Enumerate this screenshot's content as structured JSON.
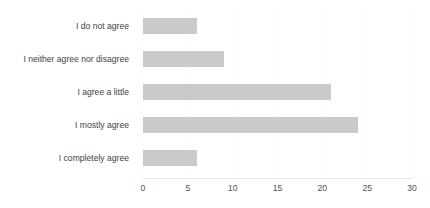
{
  "chart_data": {
    "type": "bar",
    "orientation": "horizontal",
    "title": "",
    "xlabel": "",
    "ylabel": "",
    "categories": [
      "I do not agree",
      "I neither agree nor disagree",
      "I agree a little",
      "I mostly agree",
      "I completely agree"
    ],
    "values": [
      6,
      9,
      21,
      24,
      6
    ],
    "xlim": [
      0,
      30
    ],
    "xticks": [
      0,
      5,
      10,
      15,
      20,
      25,
      30
    ],
    "xtick_labels": [
      "0",
      "5",
      "10",
      "15",
      "20",
      "25",
      "30"
    ],
    "grid": true,
    "grid_axis": "x",
    "legend": false,
    "series": [
      {
        "name": "Responses",
        "values": [
          6,
          9,
          21,
          24,
          6
        ],
        "color": "#cacaca"
      }
    ]
  },
  "style": {
    "bar_color": "#cacaca",
    "label_color": "#3f3f3f",
    "tick_color": "#505050",
    "gridline_color": "#fbfbfb",
    "axis_color": "#e8e8e8",
    "background": "#ffffff"
  }
}
